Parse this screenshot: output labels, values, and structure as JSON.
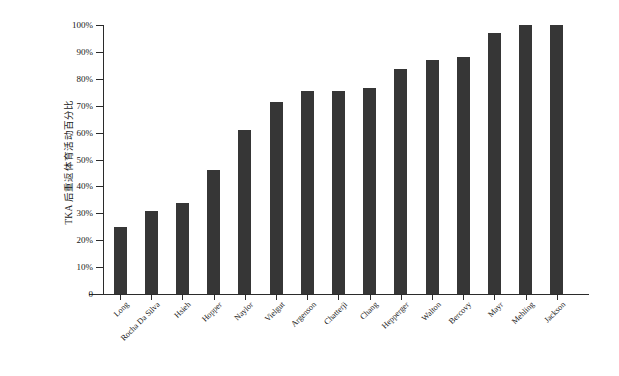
{
  "chart_data": {
    "type": "bar",
    "title": "",
    "subtitle": "",
    "xlabel": "",
    "ylabel": "TKA 后重返体育活动百分比",
    "ylim": [
      0,
      100
    ],
    "yunit": "%",
    "ytick_labels": [
      "0",
      "10%",
      "20%",
      "30%",
      "40%",
      "50%",
      "60%",
      "70%",
      "80%",
      "90%",
      "100%"
    ],
    "ytick_values": [
      0,
      10,
      20,
      30,
      40,
      50,
      60,
      70,
      80,
      90,
      100
    ],
    "grid": false,
    "legend": false,
    "bar_color": "#363636",
    "axis_color": "#2b2b2b",
    "background": "#ffffff",
    "categories": [
      "Long",
      "Rocha Da Silva",
      "Hsieh",
      "Hopper",
      "Naylor",
      "Vielgut",
      "Argenson",
      "Chatterji",
      "Chang",
      "Hepperger",
      "Walton",
      "Bercovy",
      "Mayr",
      "Mehling",
      "Jackson"
    ],
    "values": [
      25,
      31,
      34,
      46,
      61,
      71.5,
      75.5,
      75.5,
      76.5,
      83.5,
      87,
      88,
      97,
      100,
      100
    ]
  }
}
